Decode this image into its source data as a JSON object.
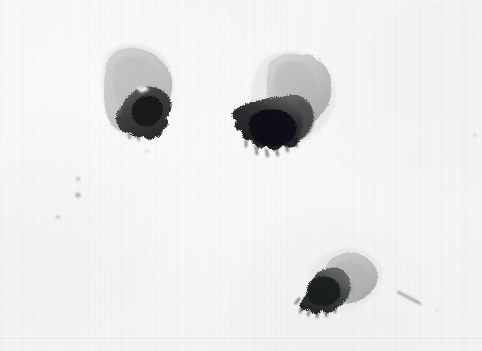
{
  "artwork": {
    "title": "Three grayscale ink-wash blots on textured paper",
    "medium": "ink wash / watercolor on paper",
    "palette": {
      "paper": "#f6f6f4",
      "paper_highlight": "#fbfbfa",
      "paper_shadow": "#f0f0ee",
      "wash_pale": "#c9cbc8",
      "wash_mid": "#8e9290",
      "wash_dark": "#4a4c4b",
      "wash_darkest": "#1d1e1f",
      "speck": "#b9bbb8"
    },
    "canvas": {
      "width": 482,
      "height": 351
    },
    "blots": [
      {
        "name": "upper-left-blot",
        "label": "Upper left blot",
        "bbox": [
          100,
          44,
          75,
          95
        ],
        "pale_lobe": "upper-left leaf-shaped pale gray wash",
        "dark_lobe": "lower-right dark saturated wash",
        "notes": "small white reserve gap near center-right edge"
      },
      {
        "name": "center-blot",
        "label": "Center blot",
        "bbox": [
          248,
          50,
          95,
          105
        ],
        "pale_lobe": "upper-right pale gray rounded lobe",
        "dark_lobe": "lower-left very dark wash with drip tendrils",
        "notes": "darkest mass in the composition"
      },
      {
        "name": "lower-right-blot",
        "label": "Lower right blot",
        "bbox": [
          305,
          248,
          80,
          68
        ],
        "pale_lobe": "upper-right pale gray angular lobe",
        "dark_lobe": "left dark wash with comb-like bottom drips",
        "notes": "thin diagonal streak trails off to the right"
      }
    ],
    "marks": [
      {
        "name": "speck-upper",
        "x": 78,
        "y": 179,
        "size": 4
      },
      {
        "name": "speck-middle",
        "x": 78,
        "y": 195,
        "size": 5
      },
      {
        "name": "speck-lower",
        "x": 58,
        "y": 217,
        "size": 4
      },
      {
        "name": "speck-right-edge",
        "x": 475,
        "y": 135,
        "size": 3
      },
      {
        "name": "speck-bottom-right",
        "x": 437,
        "y": 310,
        "size": 3
      },
      {
        "name": "speck-center-low",
        "x": 147,
        "y": 151,
        "size": 3
      },
      {
        "name": "streak-lower-right",
        "x": 398,
        "y": 293,
        "size": 0
      }
    ]
  }
}
